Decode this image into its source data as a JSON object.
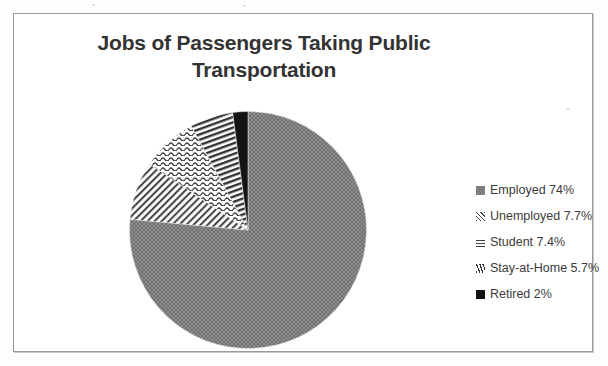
{
  "chart_data": {
    "type": "pie",
    "title": "Jobs of Passengers Taking Public Transportation",
    "title_line1": "Jobs of Passengers Taking Public",
    "title_line2": "Transportation",
    "categories": [
      "Employed",
      "Unemployed",
      "Student",
      "Stay-at-Home",
      "Retired"
    ],
    "values": [
      74,
      7.7,
      7.4,
      5.7,
      2
    ],
    "value_labels": [
      "74%",
      "7.7%",
      "7.4%",
      "5.7%",
      "2%"
    ],
    "units": "percent",
    "legend_position": "right",
    "grid": false,
    "xlabel": "",
    "ylabel": "",
    "start_angle_deg": 0,
    "direction": "clockwise",
    "slices": [
      {
        "name": "Employed",
        "value": 74,
        "label": "Employed 74%",
        "pattern": "dotted-halftone",
        "color": "#808080",
        "swatch": "dotted-halftone"
      },
      {
        "name": "Unemployed",
        "value": 7.7,
        "label": "Unemployed 7.7%",
        "pattern": "diagonal-lines",
        "color": "#585858",
        "swatch": "diagonal-lines"
      },
      {
        "name": "Student",
        "value": 7.4,
        "label": "Student 7.4%",
        "pattern": "wavy-lines",
        "color": "#4f4f4f",
        "swatch": "wavy-lines"
      },
      {
        "name": "Stay-at-Home",
        "value": 5.7,
        "label": "Stay-at-Home 5.7%",
        "pattern": "steep-hatch",
        "color": "#3c3c3c",
        "swatch": "steep-hatch"
      },
      {
        "name": "Retired",
        "value": 2,
        "label": "Retired 2%",
        "pattern": "solid-black",
        "color": "#141414",
        "swatch": "solid-black"
      }
    ]
  },
  "legend": {
    "items": [
      {
        "label": "Employed 74%"
      },
      {
        "label": "Unemployed 7.7%"
      },
      {
        "label": "Student 7.4%"
      },
      {
        "label": "Stay-at-Home 5.7%"
      },
      {
        "label": "Retired 2%"
      }
    ]
  },
  "colors": {
    "title": "#333333",
    "legend_text": "#3b3b3b",
    "frame": "#9a9a9a",
    "background": "#ffffff"
  }
}
